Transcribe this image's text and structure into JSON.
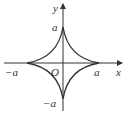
{
  "diagram": {
    "type": "astroid curve",
    "axes": {
      "x_label": "x",
      "y_label": "y",
      "origin_label": "O"
    },
    "ticks": {
      "x_pos": "a",
      "x_neg": "−a",
      "y_pos": "a",
      "y_neg": "−a"
    },
    "stroke_color": "#333333"
  }
}
